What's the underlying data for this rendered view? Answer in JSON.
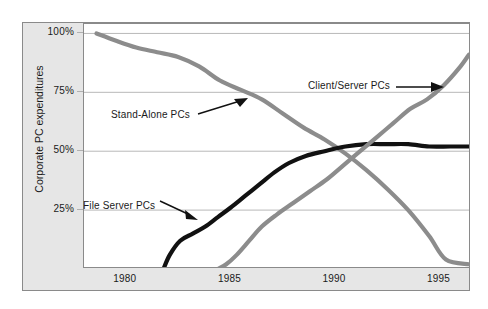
{
  "chart_data": {
    "type": "line",
    "title": "",
    "xlabel": "",
    "ylabel": "Corporate PC expenditures",
    "xlim": [
      1978,
      1996.5
    ],
    "ylim": [
      0,
      104
    ],
    "grid": "horizontal",
    "legend_position": "inline-annotations",
    "y_ticks": [
      "100%",
      "75%",
      "50%",
      "25%"
    ],
    "y_tick_values": [
      100,
      75,
      50,
      25
    ],
    "x_ticks": [
      "1980",
      "1985",
      "1990",
      "1995"
    ],
    "x_tick_values": [
      1980,
      1985,
      1990,
      1995
    ],
    "series": [
      {
        "name": "Stand-Alone PCs",
        "color": "#8c8c8c",
        "annotation_label": "Stand-Alone PCs",
        "x": [
          1978.6,
          1979.5,
          1980.5,
          1981.5,
          1982.5,
          1983.5,
          1984.5,
          1985.5,
          1986.5,
          1987.5,
          1988.5,
          1989.5,
          1990.5,
          1991.5,
          1992.5,
          1993.5,
          1994.5,
          1995.3,
          1996.4
        ],
        "values": [
          100,
          97,
          94,
          92,
          90,
          86,
          80,
          76,
          72,
          66,
          60,
          55,
          49,
          42,
          34,
          25,
          14,
          4,
          2
        ]
      },
      {
        "name": "File Server PCs",
        "color": "#111111",
        "annotation_label": "File Server PCs",
        "x": [
          1981.8,
          1982.1,
          1982.6,
          1983.2,
          1983.8,
          1984.4,
          1985.0,
          1985.7,
          1986.4,
          1987.1,
          1987.8,
          1988.6,
          1989.5,
          1990.5,
          1991.5,
          1992.5,
          1993.5,
          1994.5,
          1995.5,
          1996.4
        ],
        "values": [
          0,
          6,
          12,
          15,
          18,
          22,
          26,
          31,
          36,
          41,
          45,
          48,
          50,
          52,
          53,
          53,
          53,
          52,
          52,
          52
        ]
      },
      {
        "name": "Client/Server PCs",
        "color": "#8c8c8c",
        "annotation_label": "Client/Server PCs",
        "x": [
          1984.4,
          1984.8,
          1985.3,
          1985.9,
          1986.5,
          1987.2,
          1988.0,
          1988.8,
          1989.6,
          1990.4,
          1991.2,
          1992.0,
          1992.8,
          1993.6,
          1994.4,
          1995.2,
          1996.0,
          1996.4
        ],
        "values": [
          0,
          2,
          6,
          12,
          18,
          23,
          28,
          33,
          38,
          44,
          50,
          56,
          62,
          68,
          72,
          78,
          86,
          91
        ]
      }
    ]
  },
  "annotations": [
    {
      "label": "Stand-Alone PCs",
      "target_series": "Stand-Alone PCs"
    },
    {
      "label": "File Server PCs",
      "target_series": "File Server PCs"
    },
    {
      "label": "Client/Server PCs",
      "target_series": "Client/Server PCs"
    }
  ],
  "colors": {
    "gray_series": "#8c8c8c",
    "black_series": "#111111",
    "gridline": "#b0b0b0",
    "frame": "#8a8a8a",
    "axis_band": "#e6e6e6",
    "background": "#ffffff",
    "text": "#1a1a1a"
  }
}
